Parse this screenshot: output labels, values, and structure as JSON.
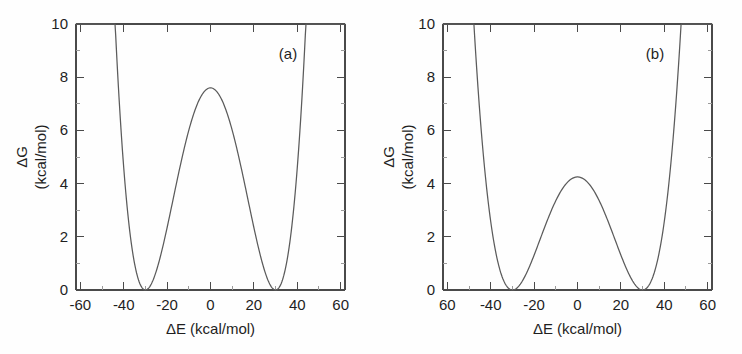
{
  "figure": {
    "background_color": "#fefefe",
    "curve_color": "#5b5b5b",
    "axis_color": "#4a4a4a"
  },
  "panels": [
    {
      "tag": "(a)",
      "xlabel": "ΔE (kcal/mol)",
      "ylabel_line1": "ΔG",
      "ylabel_line2": "(kcal/mol)",
      "xticklabels": [
        "-60",
        "-40",
        "-20",
        "0",
        "20",
        "40",
        "60"
      ],
      "yticklabels": [
        "0",
        "2",
        "4",
        "6",
        "8",
        "10"
      ]
    },
    {
      "tag": "(b)",
      "xlabel": "ΔE (kcal/mol)",
      "ylabel_line1": "ΔG",
      "ylabel_line2": "(kcal/mol)",
      "xticklabels": [
        "60",
        "-40",
        "-20",
        "0",
        "20",
        "40",
        "60"
      ],
      "yticklabels": [
        "0",
        "2",
        "4",
        "6",
        "8",
        "10"
      ]
    }
  ],
  "chart_data": [
    {
      "type": "line",
      "title": "(a)",
      "xlabel": "ΔE (kcal/mol)",
      "ylabel": "ΔG (kcal/mol)",
      "xlim": [
        -62,
        62
      ],
      "ylim": [
        0,
        10
      ],
      "xticks": [
        -60,
        -40,
        -20,
        0,
        20,
        40,
        60
      ],
      "yticks": [
        0,
        2,
        4,
        6,
        8,
        10
      ],
      "grid": false,
      "legend": "none",
      "description": "Symmetric double-well free energy profile with a central barrier of about 7.6 kcal/mol and minima near -30 and +30 kcal/mol.",
      "barrier_height": 7.6,
      "minima_positions": [
        -30,
        30
      ],
      "minima_values": [
        0,
        0
      ],
      "endpoint_values": [
        8.4,
        8.4
      ],
      "x": [
        -62,
        -60,
        -56,
        -52,
        -48,
        -44,
        -40,
        -36,
        -32,
        -30,
        -28,
        -24,
        -20,
        -16,
        -12,
        -8,
        -4,
        0,
        4,
        8,
        12,
        16,
        20,
        24,
        28,
        30,
        32,
        36,
        40,
        44,
        48,
        52,
        56,
        60,
        62
      ],
      "values": [
        8.95,
        8.4,
        6.52,
        4.93,
        3.6,
        2.52,
        1.67,
        1.01,
        0.53,
        0.36,
        0.24,
        0.1,
        0.33,
        1.09,
        2.3,
        3.81,
        5.41,
        6.83,
        7.53,
        7.38,
        6.42,
        4.95,
        3.41,
        2.0,
        0.87,
        0.45,
        0.18,
        0.01,
        0.33,
        1.2,
        2.4,
        3.95,
        5.9,
        8.4,
        9.6
      ]
    },
    {
      "type": "line",
      "title": "(b)",
      "xlabel": "ΔE (kcal/mol)",
      "ylabel": "ΔG (kcal/mol)",
      "xlim": [
        -62,
        62
      ],
      "ylim": [
        0,
        10
      ],
      "xticks": [
        -60,
        -40,
        -20,
        0,
        20,
        40,
        60
      ],
      "yticks": [
        0,
        2,
        4,
        6,
        8,
        10
      ],
      "grid": false,
      "legend": "none",
      "description": "Symmetric double-well free energy profile with a lower central barrier of about 4.2 kcal/mol and minima near -31 and +30 kcal/mol.",
      "barrier_height": 4.25,
      "minima_positions": [
        -31,
        30
      ],
      "minima_values": [
        0,
        0
      ],
      "endpoint_values": [
        8.4,
        8.4
      ],
      "x": [
        -62,
        -60,
        -56,
        -52,
        -48,
        -44,
        -40,
        -36,
        -32,
        -31,
        -28,
        -24,
        -20,
        -16,
        -12,
        -8,
        -4,
        0,
        4,
        8,
        12,
        16,
        20,
        24,
        28,
        30,
        32,
        36,
        40,
        44,
        48,
        52,
        56,
        60,
        62
      ],
      "values": [
        8.8,
        8.15,
        6.35,
        4.82,
        3.49,
        2.38,
        1.5,
        0.8,
        0.22,
        0.1,
        0.07,
        0.35,
        0.95,
        1.72,
        2.55,
        3.35,
        3.95,
        4.25,
        4.15,
        3.72,
        3.08,
        2.35,
        1.62,
        0.92,
        0.3,
        0.05,
        0.07,
        0.42,
        1.1,
        2.05,
        3.35,
        4.95,
        6.55,
        8.4,
        9.45
      ]
    }
  ]
}
